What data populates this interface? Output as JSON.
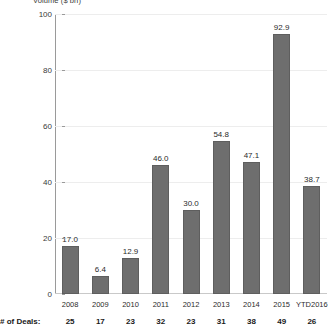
{
  "chart_data": {
    "type": "bar",
    "title": "",
    "ylabel": "Volume ($ bn)",
    "xlabel": "",
    "categories": [
      "2008",
      "2009",
      "2010",
      "2011",
      "2012",
      "2013",
      "2014",
      "2015",
      "YTD2016"
    ],
    "values": [
      17.0,
      6.4,
      12.9,
      46.0,
      30.0,
      54.8,
      47.1,
      92.9,
      38.7
    ],
    "value_labels": [
      "17.0",
      "6.4",
      "12.9",
      "46.0",
      "30.0",
      "54.8",
      "47.1",
      "92.9",
      "38.7"
    ],
    "ylim": [
      0,
      100
    ],
    "yticks": [
      0,
      20,
      40,
      60,
      80,
      100
    ],
    "ytick_labels": [
      "0",
      "20",
      "40",
      "60",
      "80",
      "100"
    ],
    "grid": true,
    "legend": "none",
    "bar_color": "#6e6e6e",
    "secondary_row": {
      "label": "# of Deals:",
      "values": [
        "25",
        "17",
        "23",
        "32",
        "23",
        "31",
        "38",
        "49",
        "26"
      ]
    }
  }
}
